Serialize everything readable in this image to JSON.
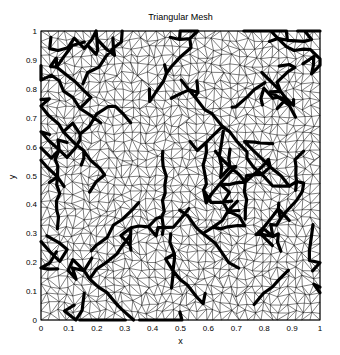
{
  "chart_data": {
    "type": "mesh",
    "title": "Triangular Mesh",
    "xlabel": "x",
    "ylabel": "y",
    "xlim": [
      0,
      1
    ],
    "ylim": [
      0,
      1
    ],
    "xticks": [
      "0",
      "0.1",
      "0.2",
      "0.3",
      "0.4",
      "0.5",
      "0.6",
      "0.7",
      "0.8",
      "0.9",
      "1"
    ],
    "yticks": [
      "0",
      "0.1",
      "0.2",
      "0.3",
      "0.4",
      "0.5",
      "0.6",
      "0.7",
      "0.8",
      "0.9",
      "1"
    ],
    "grid": false,
    "legend": null,
    "mesh": {
      "description": "Unstructured triangular mesh on the unit square with thick highlighted edge paths",
      "approx_nodes_per_side": 34,
      "edge_color": "#000000",
      "thin_edge_width": 0.5,
      "thick_edge_width": 3.2,
      "seed": 7
    }
  },
  "plot_area": {
    "left": 41,
    "top": 31,
    "width": 279,
    "height": 289
  },
  "colors": {
    "background": "#ffffff",
    "axes": "#000000"
  }
}
